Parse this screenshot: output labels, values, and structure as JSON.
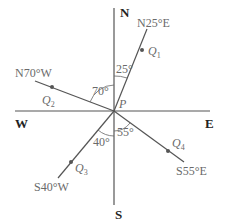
{
  "diagram": {
    "type": "compass-bearing-diagram",
    "center": {
      "label": "P"
    },
    "directions": {
      "north": "N",
      "south": "S",
      "east": "E",
      "west": "W"
    },
    "bearings": [
      {
        "point": "Q",
        "sub": "1",
        "bearing": "N25°E",
        "angle": "25°"
      },
      {
        "point": "Q",
        "sub": "2",
        "bearing": "N70°W",
        "angle": "70°"
      },
      {
        "point": "Q",
        "sub": "3",
        "bearing": "S40°W",
        "angle": "40°"
      },
      {
        "point": "Q",
        "sub": "4",
        "bearing": "S55°E",
        "angle": "55°"
      }
    ]
  }
}
